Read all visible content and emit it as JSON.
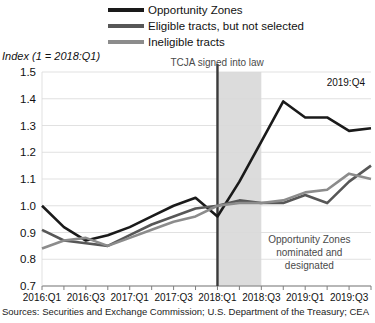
{
  "chart_data": {
    "type": "line",
    "title": "",
    "subtitle": "",
    "ylabel": "Index (1 = 2018:Q1)",
    "xlabel": "",
    "ylim": [
      0.7,
      1.5
    ],
    "yticks": [
      "0.7",
      "0.8",
      "0.9",
      "1.0",
      "1.1",
      "1.2",
      "1.3",
      "1.4",
      "1.5"
    ],
    "ytick_values": [
      0.7,
      0.8,
      0.9,
      1.0,
      1.1,
      1.2,
      1.3,
      1.4,
      1.5
    ],
    "grid": true,
    "legend_position": "top-center",
    "x": [
      "2016:Q1",
      "2016:Q2",
      "2016:Q3",
      "2016:Q4",
      "2017:Q1",
      "2017:Q2",
      "2017:Q3",
      "2017:Q4",
      "2018:Q1",
      "2018:Q2",
      "2018:Q3",
      "2018:Q4",
      "2019:Q1",
      "2019:Q2",
      "2019:Q3",
      "2019:Q4"
    ],
    "xtick_labels": [
      "2016:Q1",
      "2016:Q3",
      "2017:Q1",
      "2017:Q3",
      "2018:Q1",
      "2018:Q3",
      "2019:Q1",
      "2019:Q3"
    ],
    "xtick_indices": [
      0,
      2,
      4,
      6,
      8,
      10,
      12,
      14
    ],
    "series": [
      {
        "name": "Opportunity Zones",
        "color": "#1a1a1a",
        "values": [
          1.0,
          0.92,
          0.87,
          0.89,
          0.92,
          0.96,
          1.0,
          1.03,
          0.96,
          1.09,
          1.24,
          1.39,
          1.33,
          1.33,
          1.28,
          1.29
        ]
      },
      {
        "name": "Eligible tracts, but not selected",
        "color": "#575757",
        "values": [
          0.91,
          0.87,
          0.86,
          0.85,
          0.89,
          0.93,
          0.96,
          0.99,
          1.0,
          1.02,
          1.01,
          1.01,
          1.04,
          1.01,
          1.09,
          1.15
        ]
      },
      {
        "name": "Ineligible tracts",
        "color": "#8c8c8c",
        "values": [
          0.84,
          0.87,
          0.88,
          0.85,
          0.88,
          0.91,
          0.94,
          0.96,
          1.0,
          1.01,
          1.01,
          1.02,
          1.05,
          1.06,
          1.12,
          1.1
        ]
      }
    ],
    "annotations": [
      {
        "name": "tcja-line-label",
        "text": "TCJA signed into law",
        "at_x": "2018:Q1"
      },
      {
        "name": "shaded-region-label",
        "lines": [
          "Opportunity Zones",
          "nominated and",
          "designated"
        ],
        "from_x": "2018:Q1",
        "to_x": "2018:Q3"
      },
      {
        "name": "end-point-label",
        "text": "2019:Q4"
      }
    ],
    "source": "Sources: Securities and Exchange Commission; U.S. Department of the Treasury; CEA"
  },
  "legend": {
    "items": [
      {
        "label": "Opportunity Zones",
        "color": "#1a1a1a"
      },
      {
        "label": "Eligible tracts, but not selected",
        "color": "#575757"
      },
      {
        "label": "Ineligible tracts",
        "color": "#8c8c8c"
      }
    ]
  },
  "annotations": {
    "tcja": "TCJA signed into law",
    "endpoint": "2019:Q4",
    "shaded_line1": "Opportunity Zones",
    "shaded_line2": "nominated and",
    "shaded_line3": "designated"
  },
  "axis": {
    "ylabel": "Index (1 = 2018:Q1)"
  },
  "source": {
    "text": "Sources: Securities and Exchange Commission; U.S. Department of the Treasury; CEA"
  }
}
